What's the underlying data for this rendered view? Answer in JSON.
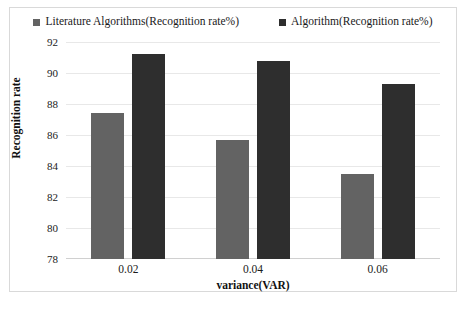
{
  "chart_data": {
    "type": "bar",
    "title": "",
    "xlabel": "variance(VAR)",
    "ylabel": "Recognition rate",
    "categories": [
      "0.02",
      "0.04",
      "0.06"
    ],
    "series": [
      {
        "name": "Literature Algorithms(Recognition rate%)",
        "color": "#636363",
        "values": [
          87.4,
          85.7,
          83.5
        ]
      },
      {
        "name": "Algorithm(Recognition rate%)",
        "color": "#2e2e2e",
        "values": [
          91.2,
          90.8,
          89.3
        ]
      }
    ],
    "ylim": [
      78,
      92
    ],
    "ytick_values": [
      78,
      80,
      82,
      84,
      86,
      88,
      90,
      92
    ],
    "ytick_labels": [
      "78",
      "80",
      "82",
      "84",
      "86",
      "88",
      "90",
      "92"
    ],
    "grid": true,
    "legend_position": "top-center"
  },
  "legend": {
    "entries": [
      {
        "label": "Literature Algorithms(Recognition rate%)",
        "color": "#636363"
      },
      {
        "label": "Algorithm(Recognition rate%)",
        "color": "#2e2e2e"
      }
    ]
  },
  "axes": {
    "x_title": "variance(VAR)",
    "y_title": "Recognition rate"
  }
}
